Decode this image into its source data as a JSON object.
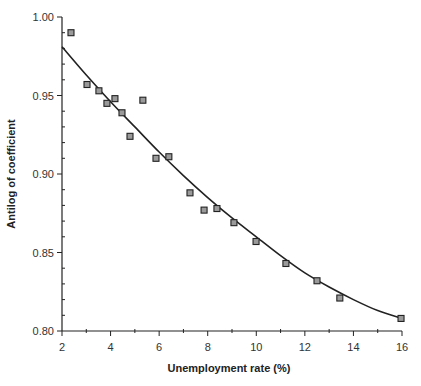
{
  "chart_data": {
    "type": "scatter",
    "title": "",
    "xlabel": "Unemployment rate (%)",
    "ylabel": "Antilog of coefficient",
    "xlim": [
      2,
      16
    ],
    "ylim": [
      0.8,
      1.0
    ],
    "grid": false,
    "legend": null,
    "x_ticks": [
      2,
      4,
      6,
      8,
      10,
      12,
      14,
      16
    ],
    "x_tick_labels": [
      "2",
      "4",
      "6",
      "8",
      "10",
      "12",
      "14",
      "16"
    ],
    "y_ticks": [
      0.8,
      0.85,
      0.9,
      0.95,
      1.0
    ],
    "y_tick_labels": [
      "0.80",
      "0.85",
      "0.90",
      "0.95",
      "1.00"
    ],
    "series": [
      {
        "name": "observed",
        "kind": "scatter",
        "marker": "square",
        "x": [
          2.37,
          3.03,
          3.52,
          3.85,
          4.18,
          4.47,
          4.8,
          5.33,
          5.87,
          6.4,
          7.27,
          7.85,
          8.38,
          9.08,
          9.99,
          11.22,
          12.5,
          13.44,
          15.96
        ],
        "y": [
          0.99,
          0.957,
          0.953,
          0.945,
          0.948,
          0.939,
          0.924,
          0.947,
          0.91,
          0.911,
          0.888,
          0.877,
          0.878,
          0.869,
          0.857,
          0.843,
          0.832,
          0.821,
          0.808
        ]
      },
      {
        "name": "fitted curve",
        "kind": "line",
        "x": [
          2.0,
          3.0,
          4.0,
          5.0,
          6.0,
          7.0,
          8.0,
          9.0,
          10.0,
          11.0,
          12.0,
          13.0,
          14.0,
          15.0,
          16.0
        ],
        "y": [
          0.981,
          0.963,
          0.946,
          0.93,
          0.914,
          0.899,
          0.885,
          0.872,
          0.86,
          0.848,
          0.837,
          0.828,
          0.82,
          0.813,
          0.808
        ]
      }
    ]
  },
  "labels": {
    "xlabel": "Unemployment rate (%)",
    "ylabel": "Antilog of coefficient"
  }
}
